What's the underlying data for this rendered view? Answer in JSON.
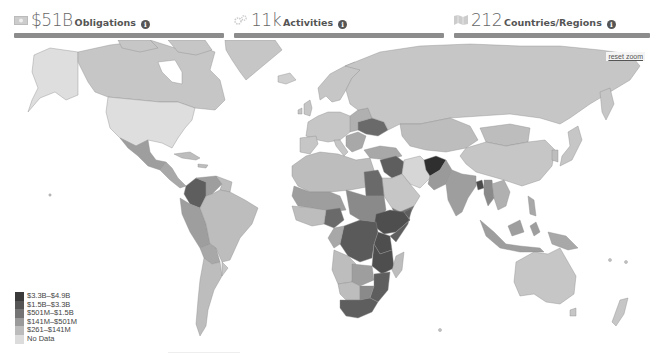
{
  "stats": [
    {
      "icon": "money-icon",
      "value": "$51B",
      "label": "Obligations",
      "info": "i"
    },
    {
      "icon": "gears-icon",
      "value": "11k",
      "label": "Activities",
      "info": "i"
    },
    {
      "icon": "map-icon",
      "value": "212",
      "label": "Countries/Regions",
      "info": "i"
    }
  ],
  "map": {
    "reset_zoom_label": "reset zoom",
    "colors": {
      "tier1": "#3a3a3a",
      "tier2": "#5e5e5e",
      "tier3": "#7d7d7d",
      "tier4": "#9e9e9e",
      "tier5": "#bdbdbd",
      "nodata": "#dedede",
      "ocean": "#ffffff",
      "border": "#8a8a8a"
    }
  },
  "legend": {
    "items": [
      {
        "label": "$3.3B–$4.9B",
        "color": "#3a3a3a"
      },
      {
        "label": "$1.5B–$3.3B",
        "color": "#555555"
      },
      {
        "label": "$501M–$1.5B",
        "color": "#747474"
      },
      {
        "label": "$141M–$501M",
        "color": "#9a9a9a"
      },
      {
        "label": "$261–$141M",
        "color": "#bcbcbc"
      },
      {
        "label": "No Data",
        "color": "#dcdcdc"
      }
    ]
  }
}
